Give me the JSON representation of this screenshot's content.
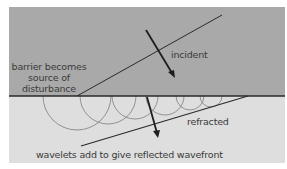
{
  "diagram": {
    "colors": {
      "upper_medium": "#a9a9a9",
      "lower_medium": "#dedede",
      "barrier": "#2a2a2a",
      "wavefront": "#2a2a2a",
      "wavelet": "#7a7a7a",
      "arrow": "#1e1e1e",
      "text": "#3a3a3a"
    },
    "labels": {
      "barrier_line1": "barrier becomes",
      "barrier_line2": "source of",
      "barrier_line3": "disturbance",
      "incident": "incident",
      "refracted": "refracted",
      "caption": "wavelets add to give reflected wavefront"
    }
  }
}
